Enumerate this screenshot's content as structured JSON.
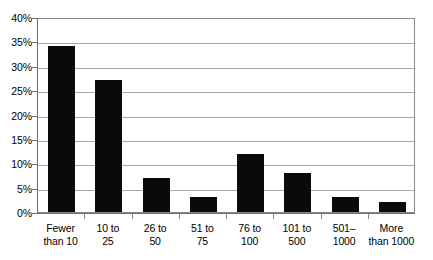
{
  "chart_data": {
    "type": "bar",
    "title": "",
    "xlabel": "",
    "ylabel": "",
    "categories": [
      "Fewer\nthan 10",
      "10 to\n25",
      "26 to\n50",
      "51 to\n75",
      "76 to\n100",
      "101 to\n500",
      "501–\n1000",
      "More\nthan 1000"
    ],
    "values": [
      34,
      27,
      7,
      3,
      12,
      8,
      3,
      2
    ],
    "ylim": [
      0,
      40
    ],
    "ytick_values": [
      0,
      5,
      10,
      15,
      20,
      25,
      30,
      35,
      40
    ],
    "ytick_labels": [
      "0%",
      "5%",
      "10%",
      "15%",
      "20%",
      "25%",
      "30%",
      "35%",
      "40%"
    ],
    "grid": true,
    "legend": null,
    "bar_color": "#0a0a0a",
    "grid_color": "#a8a8a8",
    "axis_color": "#6e6e6e",
    "background_color": "#ffffff"
  }
}
